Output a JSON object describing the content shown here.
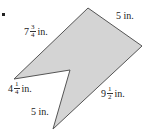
{
  "figure": {
    "fill_color": "#d4d4d4",
    "stroke_color": "#555555",
    "vertices": {
      "top": [
        88,
        8
      ],
      "right": [
        142,
        46
      ],
      "bottom": [
        53,
        129
      ],
      "notch": [
        70,
        70
      ],
      "left": [
        14,
        79
      ]
    },
    "polygon_points": "88,8 142,46 53,129 70,70 14,79"
  },
  "labels": {
    "top_left_edge": {
      "whole": "7",
      "numerator": "3",
      "denominator": "4",
      "unit": "in."
    },
    "top_right_edge": {
      "text": "5 in."
    },
    "notch_left_edge": {
      "whole": "4",
      "numerator": "1",
      "denominator": "4",
      "unit": "in."
    },
    "notch_lower_edge": {
      "text": "5 in."
    },
    "bottom_right_edge": {
      "whole": "9",
      "numerator": "1",
      "denominator": "2",
      "unit": "in."
    }
  }
}
